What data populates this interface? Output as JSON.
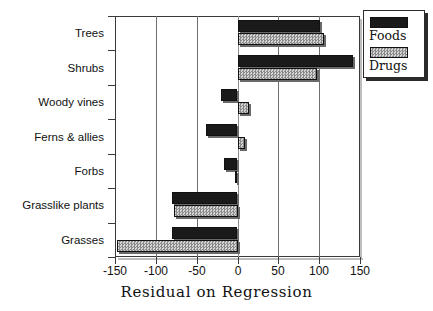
{
  "chart_data": {
    "type": "bar",
    "orientation": "horizontal",
    "title": "",
    "xlabel": "Residual on Regression",
    "ylabel": "",
    "xlim": [
      -150,
      150
    ],
    "xticks": [
      "-150",
      "-100",
      "-50",
      "0",
      "50",
      "100",
      "150"
    ],
    "xtick_values": [
      -150,
      -100,
      -50,
      0,
      50,
      100,
      150
    ],
    "grid": true,
    "grid_axis": "x",
    "legend_position": "upper-right",
    "categories": [
      "Trees",
      "Shrubs",
      "Woody vines",
      "Ferns & allies",
      "Forbs",
      "Grasslike plants",
      "Grasses"
    ],
    "series": [
      {
        "name": "Foods",
        "color": "#1a1a1a",
        "values": [
          100,
          141,
          -20,
          -38,
          -16,
          -80,
          -80
        ]
      },
      {
        "name": "Drugs",
        "color": "#a8a8a8",
        "values": [
          105,
          97,
          13,
          9,
          -3,
          -78,
          -148
        ]
      }
    ]
  },
  "legend": {
    "entries": [
      {
        "label": "Foods",
        "swatch": "black-solid-swatch"
      },
      {
        "label": "Drugs",
        "swatch": "gray-stipple-swatch"
      }
    ]
  }
}
